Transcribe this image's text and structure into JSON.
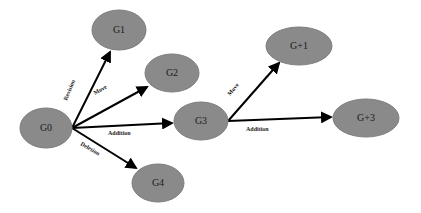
{
  "diagram": {
    "colors": {
      "node_fill": "#8a8a8a",
      "edge": "#000000",
      "background": "#ffffff"
    },
    "nodes": [
      {
        "id": "G0",
        "label": "G0",
        "cx": 46,
        "cy": 128,
        "rx": 26,
        "ry": 20
      },
      {
        "id": "G1",
        "label": "G1",
        "cx": 119,
        "cy": 30,
        "rx": 27,
        "ry": 20
      },
      {
        "id": "G2",
        "label": "G2",
        "cx": 172,
        "cy": 73,
        "rx": 27,
        "ry": 19
      },
      {
        "id": "G3",
        "label": "G3",
        "cx": 201,
        "cy": 121,
        "rx": 27,
        "ry": 19
      },
      {
        "id": "G4",
        "label": "G4",
        "cx": 158,
        "cy": 183,
        "rx": 26,
        "ry": 19
      },
      {
        "id": "G+1",
        "label": "G+1",
        "cx": 299,
        "cy": 46,
        "rx": 33,
        "ry": 19
      },
      {
        "id": "G+3",
        "label": "G+3",
        "cx": 366,
        "cy": 118,
        "rx": 33,
        "ry": 19
      }
    ],
    "edges": [
      {
        "from": "G0",
        "to": "G1",
        "label": "Revision"
      },
      {
        "from": "G0",
        "to": "G2",
        "label": "Move"
      },
      {
        "from": "G0",
        "to": "G3",
        "label": "Addition"
      },
      {
        "from": "G0",
        "to": "G4",
        "label": "Deletion"
      },
      {
        "from": "G3",
        "to": "G+1",
        "label": "Move"
      },
      {
        "from": "G3",
        "to": "G+3",
        "label": "Addition"
      }
    ]
  }
}
